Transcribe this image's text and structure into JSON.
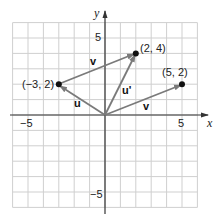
{
  "diagram": {
    "type": "coordinate-plane-vectors",
    "axes": {
      "x_label": "x",
      "y_label": "y",
      "x_range": [
        -6,
        6
      ],
      "y_range": [
        -6,
        6
      ],
      "ticks": {
        "x_neg": "−5",
        "x_pos": "5",
        "y_pos": "5",
        "y_neg": "−5"
      },
      "grid": true
    },
    "points": [
      {
        "x": -3,
        "y": 2,
        "label": "(−3, 2)"
      },
      {
        "x": 2,
        "y": 4,
        "label": "(2, 4)"
      },
      {
        "x": 5,
        "y": 2,
        "label": "(5, 2)"
      }
    ],
    "vectors": [
      {
        "name": "u",
        "from": [
          0,
          0
        ],
        "to": [
          -3,
          2
        ],
        "label": "u"
      },
      {
        "name": "v_top",
        "from": [
          -3,
          2
        ],
        "to": [
          2,
          4
        ],
        "label": "v"
      },
      {
        "name": "u_prime",
        "from": [
          0,
          0
        ],
        "to": [
          2,
          4
        ],
        "label": "u'"
      },
      {
        "name": "v_bottom",
        "from": [
          0,
          0
        ],
        "to": [
          5,
          2
        ],
        "label": "v"
      }
    ],
    "colors": {
      "grid": "#c8c8c8",
      "axis": "#333333",
      "vector": "#7a7a7a",
      "point": "#111111"
    }
  }
}
